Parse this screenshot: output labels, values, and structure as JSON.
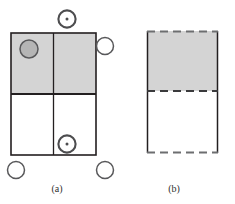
{
  "figure": {
    "panels": [
      {
        "id": "a",
        "caption": "(a)",
        "description": "Two-by-two cell grid with shaded upper row",
        "grid": {
          "x": 11,
          "y": 33,
          "width": 85,
          "height": 122,
          "mid_x": 53,
          "mid_y": 94,
          "stroke": "#231f20",
          "stroke_width": 1.6,
          "shaded_fill": "#d4d4d4",
          "plain_fill": "#ffffff"
        },
        "markers": [
          {
            "name": "filled-circle-marker",
            "type": "filled",
            "cx": 29,
            "cy": 49,
            "r": 9,
            "fill": "#b5b5b5",
            "stroke": "#58585a"
          },
          {
            "name": "dot-circle-marker-top",
            "type": "dot-circle",
            "cx": 67,
            "cy": 19,
            "r": 9,
            "fill": "#ffffff",
            "stroke": "#4d4d4f",
            "dot_r": 1.6
          },
          {
            "name": "dot-circle-marker-inner",
            "type": "dot-circle",
            "cx": 67,
            "cy": 144,
            "r": 9,
            "fill": "#ffffff",
            "stroke": "#4d4d4f",
            "dot_r": 1.6
          },
          {
            "name": "open-circle-marker-right",
            "type": "open",
            "cx": 105,
            "cy": 46,
            "r": 8.5,
            "fill": "#ffffff",
            "stroke": "#58585a"
          },
          {
            "name": "open-circle-marker-bottom-left",
            "type": "open",
            "cx": 16,
            "cy": 170,
            "r": 8.5,
            "fill": "#ffffff",
            "stroke": "#58585a"
          },
          {
            "name": "open-circle-marker-bottom-right",
            "type": "open",
            "cx": 105,
            "cy": 170,
            "r": 8.5,
            "fill": "#ffffff",
            "stroke": "#58585a"
          }
        ]
      },
      {
        "id": "b",
        "caption": "(b)",
        "description": "Rectangle with shaded upper half, dashed top, middle and bottom edges",
        "rect": {
          "x": 147,
          "y": 31,
          "width": 71,
          "height": 122,
          "mid_y": 91,
          "solid_stroke": "#231f20",
          "dashed_stroke": "#6d6e70",
          "stroke_width": 1.6,
          "dash_pattern": "7 5",
          "shaded_fill": "#d4d4d4",
          "plain_fill": "#ffffff"
        }
      }
    ]
  }
}
